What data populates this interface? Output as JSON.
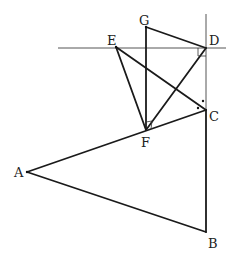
{
  "diagram": {
    "type": "geometry-figure",
    "points": {
      "A": {
        "label": "A",
        "x": 27,
        "y": 172
      },
      "B": {
        "label": "B",
        "x": 206,
        "y": 232
      },
      "C": {
        "label": "C",
        "x": 206,
        "y": 110
      },
      "D": {
        "label": "D",
        "x": 206,
        "y": 48
      },
      "E": {
        "label": "E",
        "x": 116,
        "y": 47
      },
      "F": {
        "label": "F",
        "x": 146,
        "y": 130
      },
      "G": {
        "label": "G",
        "x": 146,
        "y": 27
      }
    },
    "lines": [
      {
        "name": "horizontal-line-through-D",
        "from": [
          58,
          48
        ],
        "to": [
          226,
          48
        ]
      },
      {
        "name": "vertical-line-through-D",
        "from": [
          206,
          14
        ],
        "to": [
          206,
          232
        ]
      }
    ],
    "segments": [
      "AB",
      "BC",
      "CA",
      "GF",
      "GD",
      "EF",
      "EC",
      "FD"
    ],
    "annotations": {
      "right_angle_D": "angle between horizontal line and vertical line at D",
      "right_angle_F": "angle GFD marked as right angle",
      "equal_angles_C": "two dots marking equal angles at C"
    }
  }
}
